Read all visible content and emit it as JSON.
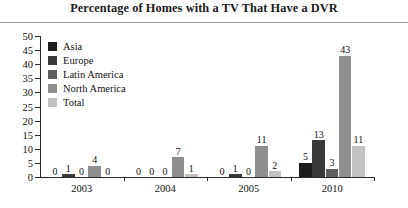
{
  "chart_data": {
    "type": "bar",
    "title": "Percentage of Homes with a TV That Have a DVR",
    "xlabel": "",
    "ylabel": "",
    "ylim": [
      0,
      50
    ],
    "yticks": [
      0,
      5,
      10,
      15,
      20,
      25,
      30,
      35,
      40,
      45,
      50
    ],
    "grid": false,
    "legend_position": "upper-left-inside",
    "categories": [
      "2003",
      "2004",
      "2005",
      "2010"
    ],
    "series": [
      {
        "name": "Asia",
        "color": "#1c1c1c",
        "values": [
          0,
          0,
          0,
          5
        ]
      },
      {
        "name": "Europe",
        "color": "#3a3a3a",
        "values": [
          1,
          0,
          1,
          13
        ]
      },
      {
        "name": "Latin America",
        "color": "#5e5e5e",
        "values": [
          0,
          0,
          0,
          3
        ]
      },
      {
        "name": "North America",
        "color": "#8f8f8f",
        "values": [
          4,
          7,
          11,
          43
        ]
      },
      {
        "name": "Total",
        "color": "#c2c2c2",
        "values": [
          0,
          1,
          2,
          11
        ]
      }
    ],
    "data_labels": [
      [
        "0",
        "1",
        "0",
        "4",
        "0"
      ],
      [
        "0",
        "0",
        "0",
        "7",
        "1"
      ],
      [
        "0",
        "1",
        "0",
        "11",
        "2"
      ],
      [
        "5",
        "13",
        "3",
        "43",
        "11"
      ]
    ]
  }
}
